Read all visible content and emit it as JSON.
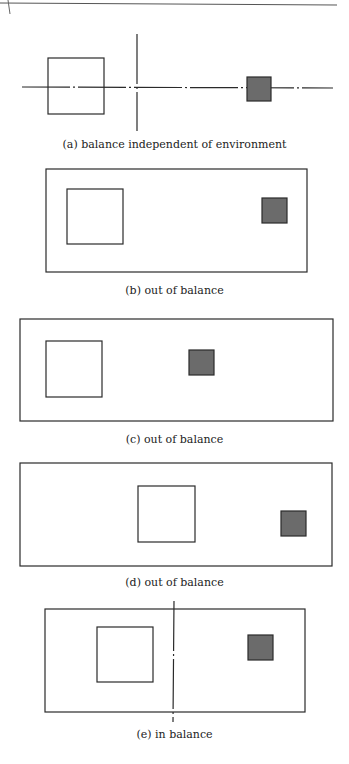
{
  "colors": {
    "stroke": "#2a2a2a",
    "gray_fill": "#6b6b6b",
    "background": "#ffffff"
  },
  "panels": [
    {
      "id": "a",
      "caption": "(a) balance independent of environment"
    },
    {
      "id": "b",
      "caption": "(b) out of balance"
    },
    {
      "id": "c",
      "caption": "(c) out of balance"
    },
    {
      "id": "d",
      "caption": "(d) out of balance"
    },
    {
      "id": "e",
      "caption": "(e) in balance"
    }
  ]
}
